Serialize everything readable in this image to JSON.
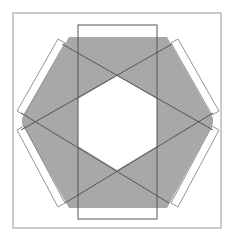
{
  "diagram": {
    "colors": {
      "background": "#ffffff",
      "frame_stroke": "#9a9a9a",
      "hexagon_fill": "#a8a8a8",
      "line_stroke": "#555555",
      "rect_stroke": "#7a7a7a"
    },
    "frame": {
      "x": 13,
      "y": 13,
      "width": 208,
      "height": 215
    },
    "hexagon_points": "69,37 167,37 213,118 213,124 167,208 69,208 22,124 22,118",
    "inner_hexagon_points": "117,76 157,99 157,146 117,170 78,146 78,99",
    "vertical_rect": {
      "x": 78,
      "y": 25,
      "width": 79,
      "height": 194
    },
    "tilted_rects": [
      {
        "name": "upper-left",
        "points": "58,39 65,43 24,115 17,111"
      },
      {
        "name": "upper-right",
        "points": "178,39 219,111 212,115 171,43"
      },
      {
        "name": "lower-left",
        "points": "17,130 24,126 65,203 58,207"
      },
      {
        "name": "lower-right",
        "points": "212,126 219,130 178,207 171,203"
      }
    ],
    "lines": [
      {
        "name": "line-a",
        "x1": 62,
        "y1": 44,
        "x2": 213,
        "y2": 130
      },
      {
        "name": "line-b",
        "x1": 172,
        "y1": 44,
        "x2": 21,
        "y2": 130
      },
      {
        "name": "line-c",
        "x1": 213,
        "y1": 113,
        "x2": 65,
        "y2": 203
      },
      {
        "name": "line-d",
        "x1": 21,
        "y1": 113,
        "x2": 169,
        "y2": 203
      }
    ]
  }
}
